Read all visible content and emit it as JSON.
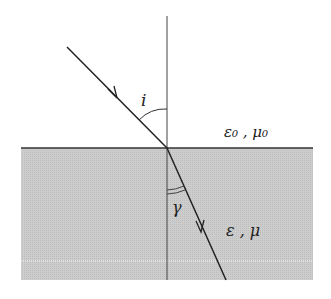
{
  "diagram": {
    "labels": {
      "incidence_angle": "i",
      "refraction_angle": "γ",
      "upper_medium": "ε₀ , μ₀",
      "lower_medium": "ε , μ"
    },
    "colors": {
      "background": "#ffffff",
      "lower_medium_fill": "#c9c9c9",
      "line": "#222222"
    },
    "geometry": {
      "normal": {
        "x": 167,
        "y1": 16,
        "y2": 280
      },
      "interface": {
        "y": 148,
        "x1": 21,
        "x2": 313
      },
      "incident_ray": {
        "x1": 67,
        "y1": 47,
        "x2": 167,
        "y2": 148
      },
      "refracted_ray": {
        "x1": 167,
        "y1": 148,
        "x2": 226,
        "y2": 280
      }
    }
  }
}
